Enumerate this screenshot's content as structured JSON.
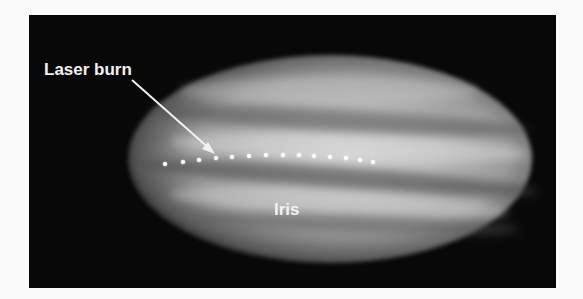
{
  "figure": {
    "background_color": "#080808",
    "labels": {
      "laser_burn": "Laser burn",
      "iris": "Iris"
    },
    "laser_burn_spot_count": 14,
    "annotation_arrow": {
      "from_label": "Laser burn",
      "points_to": "laser burn spots"
    }
  }
}
